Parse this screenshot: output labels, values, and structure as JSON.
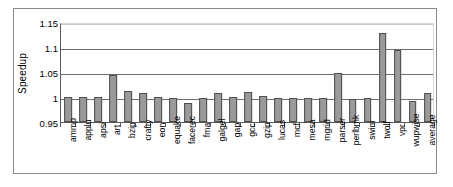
{
  "chart_data": {
    "type": "bar",
    "title": "",
    "subtitle": "",
    "xlabel": "",
    "ylabel": "Speedup",
    "ylim": [
      0.95,
      1.15
    ],
    "yticks": [
      "0.95",
      "1",
      "1.05",
      "1.1",
      "1.15"
    ],
    "ytick_values": [
      0.95,
      1.0,
      1.05,
      1.1,
      1.15
    ],
    "grid": "horizontal",
    "legend": "none",
    "bar_color": "#9a9a9a",
    "bar_edge_color": "#4f4f4f",
    "categories": [
      "ammp",
      "applu",
      "apsi",
      "art",
      "bzip",
      "crafty",
      "eon",
      "equake",
      "facerec",
      "fma",
      "galgel",
      "gap",
      "gcc",
      "gzip",
      "lucas",
      "mcf",
      "mesa",
      "mgrid",
      "parser",
      "perlbmk",
      "swim",
      "twolf",
      "vpr",
      "wupwise",
      "average"
    ],
    "values": [
      1.0,
      1.0,
      1.0,
      1.044,
      1.012,
      1.008,
      1.0,
      0.999,
      0.988,
      0.998,
      1.008,
      1.0,
      1.011,
      1.002,
      0.998,
      0.999,
      0.999,
      0.999,
      1.049,
      0.997,
      0.998,
      1.129,
      1.094,
      0.993,
      1.009
    ]
  }
}
